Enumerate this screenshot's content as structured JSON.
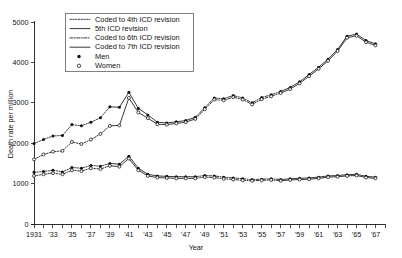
{
  "chart_data": {
    "type": "line",
    "title": "",
    "xlabel": "Year",
    "ylabel": "Death rate per million",
    "xlim": [
      1931,
      1968
    ],
    "ylim": [
      0,
      5000
    ],
    "ytick_values": [
      0,
      1000,
      2000,
      3000,
      4000,
      5000
    ],
    "ytick_labels": [
      "0",
      "1000",
      "2000",
      "3000",
      "4000",
      "5000"
    ],
    "xtick_values": [
      1931,
      1932,
      1933,
      1934,
      1935,
      1936,
      1937,
      1938,
      1939,
      1940,
      1941,
      1942,
      1943,
      1944,
      1945,
      1946,
      1947,
      1948,
      1949,
      1950,
      1951,
      1952,
      1953,
      1954,
      1955,
      1956,
      1957,
      1958,
      1959,
      1960,
      1961,
      1962,
      1963,
      1964,
      1965,
      1966,
      1967,
      1968
    ],
    "xtick_labels": [
      "1931",
      "",
      "'33",
      "",
      "'35",
      "",
      "'37",
      "",
      "'39",
      "",
      "'41",
      "",
      "'43",
      "",
      "'45",
      "",
      "'47",
      "",
      "'49",
      "",
      "'51",
      "",
      "'53",
      "",
      "'55",
      "",
      "'57",
      "",
      "'59",
      "",
      "'61",
      "",
      "'63",
      "",
      "'65",
      "",
      "'67",
      ""
    ],
    "grid": false,
    "legend_position": "upper-left",
    "x": [
      1931,
      1932,
      1933,
      1934,
      1935,
      1936,
      1937,
      1938,
      1939,
      1940,
      1941,
      1942,
      1943,
      1944,
      1945,
      1946,
      1947,
      1948,
      1949,
      1950,
      1951,
      1952,
      1953,
      1954,
      1955,
      1956,
      1957,
      1958,
      1959,
      1960,
      1961,
      1962,
      1963,
      1964,
      1965,
      1966,
      1967
    ],
    "series": [
      {
        "name": "Men",
        "marker": "filled-circle",
        "values": [
          1990,
          2090,
          2180,
          2190,
          2460,
          2430,
          2520,
          2630,
          2900,
          2890,
          3260,
          2860,
          2700,
          2520,
          2500,
          2530,
          2560,
          2640,
          2880,
          3120,
          3100,
          3180,
          3120,
          3000,
          3130,
          3200,
          3280,
          3380,
          3520,
          3700,
          3880,
          4080,
          4320,
          4650,
          4700,
          4540,
          4460
        ]
      },
      {
        "name": "Women",
        "marker": "open-circle",
        "values": [
          1600,
          1720,
          1790,
          1810,
          2030,
          1980,
          2090,
          2230,
          2430,
          2440,
          3120,
          2760,
          2620,
          2470,
          2460,
          2490,
          2520,
          2600,
          2840,
          3080,
          3060,
          3140,
          3080,
          2960,
          3090,
          3160,
          3240,
          3340,
          3480,
          3660,
          3840,
          4040,
          4280,
          4610,
          4660,
          4500,
          4420
        ]
      },
      {
        "name": "Men lower",
        "marker": "filled-circle",
        "values": [
          1280,
          1300,
          1330,
          1290,
          1400,
          1380,
          1450,
          1430,
          1500,
          1480,
          1680,
          1380,
          1230,
          1190,
          1180,
          1170,
          1170,
          1170,
          1200,
          1190,
          1160,
          1140,
          1120,
          1100,
          1110,
          1120,
          1100,
          1120,
          1130,
          1140,
          1160,
          1190,
          1200,
          1220,
          1230,
          1180,
          1160
        ]
      },
      {
        "name": "Women lower",
        "marker": "open-circle",
        "values": [
          1190,
          1230,
          1260,
          1230,
          1330,
          1310,
          1380,
          1360,
          1440,
          1420,
          1620,
          1330,
          1190,
          1150,
          1140,
          1130,
          1130,
          1130,
          1160,
          1150,
          1120,
          1100,
          1080,
          1070,
          1080,
          1090,
          1070,
          1090,
          1100,
          1110,
          1130,
          1160,
          1170,
          1190,
          1200,
          1150,
          1130
        ]
      }
    ],
    "legend_entries": [
      {
        "label": "Coded to 4th ICD revision",
        "style": "dotted"
      },
      {
        "label": "5th ICD revision",
        "style": "solid"
      },
      {
        "label": "Coded to 6th ICD revision",
        "style": "dash-dot"
      },
      {
        "label": "Coded to 7th ICD revision",
        "style": "solid"
      },
      {
        "label": "Men",
        "style": "marker-filled"
      },
      {
        "label": "Women",
        "style": "marker-open"
      }
    ],
    "colors": {
      "line": "#141414",
      "axis": "#1a1a1a",
      "background": "#ffffff"
    }
  }
}
